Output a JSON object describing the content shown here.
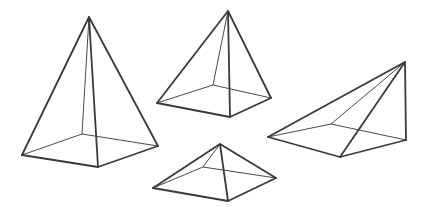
{
  "figure": {
    "background_color": "#ffffff",
    "visible_edge_color": "#3a3a3a",
    "hidden_edge_color": "#4a4a4a",
    "visible_edge_width": 1.8,
    "hidden_edge_width": 1.0,
    "width": 421,
    "height": 207
  },
  "shapes": [
    {
      "id": "tall-square-pyramid",
      "label": "Tall square pyramid",
      "position": "left",
      "base_sides": 4,
      "apex": [
        89,
        17
      ],
      "base": {
        "left": [
          22,
          155
        ],
        "front": [
          98,
          167
        ],
        "right": [
          158,
          146
        ],
        "back": [
          82,
          134
        ]
      }
    },
    {
      "id": "medium-square-pyramid",
      "label": "Medium square pyramid",
      "position": "top-center",
      "base_sides": 4,
      "apex": [
        228,
        11
      ],
      "base": {
        "left": [
          157,
          103
        ],
        "front": [
          230,
          117
        ],
        "right": [
          271,
          98
        ],
        "back": [
          213,
          85
        ]
      }
    },
    {
      "id": "oblique-pyramid",
      "label": "Oblique slanted pyramid",
      "position": "right",
      "base_sides": 4,
      "apex": [
        405,
        62
      ],
      "base": {
        "left": [
          268,
          137
        ],
        "front": [
          340,
          157
        ],
        "right": [
          406,
          140
        ],
        "back": [
          331,
          124
        ]
      }
    },
    {
      "id": "flat-square-pyramid",
      "label": "Flat wide square pyramid",
      "position": "bottom-center",
      "base_sides": 4,
      "apex": [
        220,
        144
      ],
      "base": {
        "left": [
          153,
          188
        ],
        "front": [
          228,
          201
        ],
        "right": [
          276,
          178
        ],
        "back": [
          203,
          167
        ]
      }
    }
  ]
}
